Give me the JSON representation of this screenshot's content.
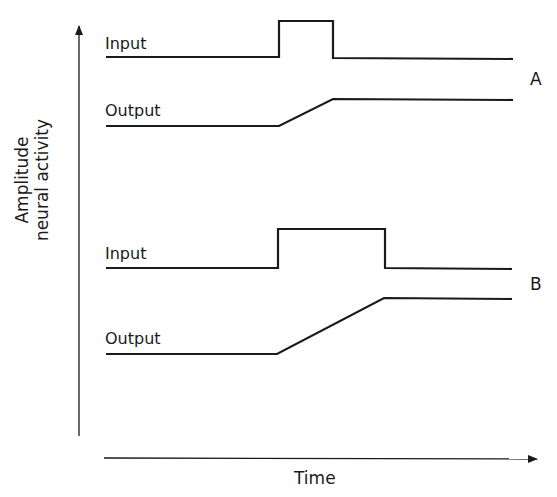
{
  "diagram": {
    "y_axis_label_line1": "Amplitude",
    "y_axis_label_line2": "neural activity",
    "x_axis_label": "Time",
    "panels": [
      {
        "id": "A",
        "input_label": "Input",
        "output_label": "Output",
        "input_pulse": {
          "start_x": 278,
          "end_x": 333,
          "description": "short input pulse"
        },
        "output_ramp": {
          "start_x": 278,
          "end_x": 333,
          "description": "output rises during pulse then holds"
        }
      },
      {
        "id": "B",
        "input_label": "Input",
        "output_label": "Output",
        "input_pulse": {
          "start_x": 278,
          "end_x": 385,
          "description": "longer input pulse"
        },
        "output_ramp": {
          "start_x": 278,
          "end_x": 385,
          "description": "output rises longer, reaching higher level, then holds"
        }
      }
    ],
    "line_color": "#1a1a1a"
  }
}
